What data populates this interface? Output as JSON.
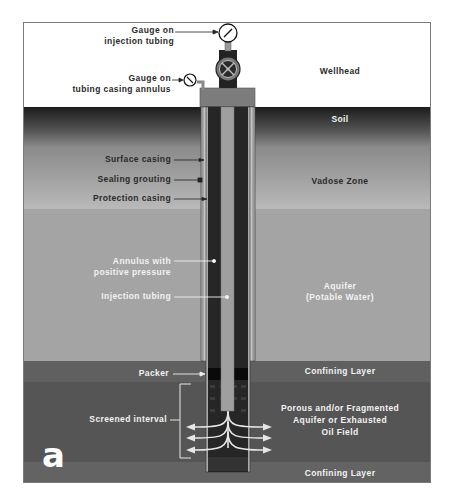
{
  "figure": {
    "panel_letter": "a",
    "layers": [
      {
        "name": "Wellhead",
        "color": "#ffffff"
      },
      {
        "name": "Soil",
        "color_top": "#1e1e1e",
        "color_bottom": "#9a9a9a"
      },
      {
        "name": "Vadose Zone",
        "color_top": "#8e8e8e",
        "color_bottom": "#b8b8b8"
      },
      {
        "name": "Aquifer\n(Potable Water)",
        "line1": "Aquifer",
        "line2": "(Potable Water)",
        "color": "#a3a3a3"
      },
      {
        "name": "Confining Layer",
        "color": "#5f5f5f"
      },
      {
        "name": "Porous and/or Fragmented Aquifer or Exhausted Oil Field",
        "line1": "Porous and/or Fragmented",
        "line2": "Aquifer or Exhausted",
        "line3": "Oil Field",
        "color": "#555555"
      },
      {
        "name": "Confining Layer",
        "color": "#626262"
      }
    ],
    "callouts": {
      "gauge_injection_line1": "Gauge on",
      "gauge_injection_line2": "injection tubing",
      "gauge_annulus_line1": "Gauge on",
      "gauge_annulus_line2": "tubing casing annulus",
      "surface_casing": "Surface casing",
      "sealing_grouting": "Sealing grouting",
      "protection_casing": "Protection casing",
      "annulus_line1": "Annulus with",
      "annulus_line2": "positive pressure",
      "injection_tubing": "Injection tubing",
      "packer": "Packer",
      "screened_interval": "Screened interval"
    },
    "zone_labels": {
      "wellhead": "Wellhead",
      "soil": "Soil",
      "vadose": "Vadose Zone",
      "aquifer_line1": "Aquifer",
      "aquifer_line2": "(Potable Water)",
      "confining_upper": "Confining Layer",
      "porous_line1": "Porous and/or Fragmented",
      "porous_line2": "Aquifer or Exhausted",
      "porous_line3": "Oil Field",
      "confining_lower": "Confining Layer"
    }
  }
}
